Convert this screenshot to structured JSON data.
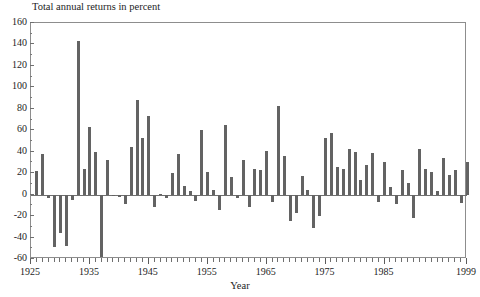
{
  "chart_data": {
    "type": "bar",
    "title": "Total annual returns in percent",
    "xlabel": "Year",
    "ylabel": "",
    "grid": false,
    "legend": null,
    "xlim": [
      1925,
      1999
    ],
    "ylim": [
      -60,
      160
    ],
    "ytick_labels": [
      "160",
      "140",
      "120",
      "100",
      "80",
      "60",
      "40",
      "20",
      "0",
      "-20",
      "-40",
      "-60"
    ],
    "ytick_values": [
      160,
      140,
      120,
      100,
      80,
      60,
      40,
      20,
      0,
      -20,
      -40,
      -60
    ],
    "xtick_labels": [
      "1925",
      "1935",
      "1945",
      "1955",
      "1965",
      "1975",
      "1985",
      "1999"
    ],
    "xtick_values": [
      1925,
      1935,
      1945,
      1955,
      1965,
      1975,
      1985,
      1999
    ],
    "bar_color": "#636363",
    "x": [
      1926,
      1927,
      1928,
      1929,
      1930,
      1931,
      1932,
      1933,
      1934,
      1935,
      1936,
      1937,
      1938,
      1939,
      1940,
      1941,
      1942,
      1943,
      1944,
      1945,
      1946,
      1947,
      1948,
      1949,
      1950,
      1951,
      1952,
      1953,
      1954,
      1955,
      1956,
      1957,
      1958,
      1959,
      1960,
      1961,
      1962,
      1963,
      1964,
      1965,
      1966,
      1967,
      1968,
      1969,
      1970,
      1971,
      1972,
      1973,
      1974,
      1975,
      1976,
      1977,
      1978,
      1979,
      1980,
      1981,
      1982,
      1983,
      1984,
      1985,
      1986,
      1987,
      1988,
      1989,
      1990,
      1991,
      1992,
      1993,
      1994,
      1995,
      1996,
      1997,
      1998,
      1999
    ],
    "values": [
      22,
      38,
      -3,
      -49,
      -36,
      -48,
      -5,
      143,
      24,
      63,
      40,
      -58,
      32,
      -1,
      -2,
      -9,
      44,
      88,
      53,
      73,
      -12,
      1,
      -3,
      20,
      38,
      8,
      3,
      -6,
      60,
      21,
      4,
      -14,
      65,
      16,
      -3,
      32,
      -12,
      24,
      23,
      41,
      -7,
      83,
      36,
      -25,
      -17,
      17,
      4,
      -31,
      -20,
      53,
      57,
      26,
      24,
      43,
      40,
      14,
      28,
      39,
      -7,
      30,
      7,
      -9,
      23,
      11,
      -22,
      43,
      24,
      21,
      3,
      34,
      18,
      23,
      -8,
      30
    ],
    "n_bars": 74
  }
}
